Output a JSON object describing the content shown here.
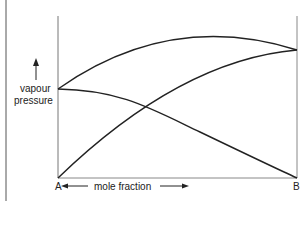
{
  "diagram": {
    "title": "",
    "y_label_line1": "vapour",
    "y_label_line2": "pressure",
    "x_label": "mole fraction",
    "left_end_label": "A",
    "right_end_label": "B",
    "curves": [
      {
        "name": "total-vapour-pressure",
        "from": "pA at x=A",
        "to": "pB at x=B",
        "shape": "concave arch above both"
      },
      {
        "name": "partial-pressure-B",
        "from": "0 at A",
        "to": "pB at B",
        "shape": "rising concave"
      },
      {
        "name": "partial-pressure-A",
        "from": "pA at A",
        "to": "0 at B",
        "shape": "falling"
      }
    ],
    "colors": {
      "line": "#222222",
      "axis": "#888888",
      "background": "#ffffff"
    }
  }
}
